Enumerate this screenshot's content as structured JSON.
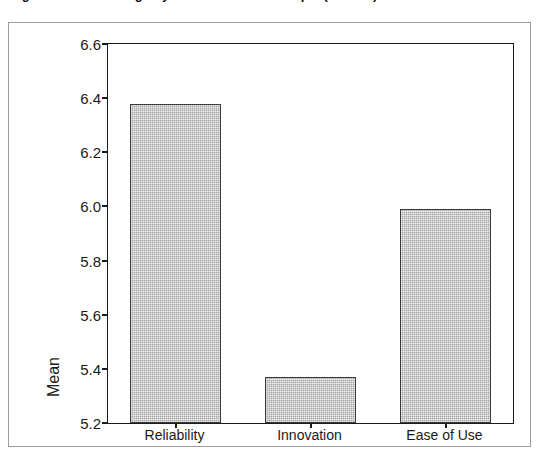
{
  "caption": {
    "text": "Figure 4. Mean ratings by attribute for the sample (n = 212)"
  },
  "chart_data": {
    "type": "bar",
    "title": "",
    "xlabel": "",
    "ylabel": "Mean",
    "categories": [
      "Reliability",
      "Innovation",
      "Ease of Use"
    ],
    "values": [
      6.38,
      5.37,
      5.99
    ],
    "ylim": [
      5.2,
      6.6
    ],
    "yticks": [
      "5.2",
      "5.4",
      "5.6",
      "5.8",
      "6.0",
      "6.2",
      "6.4",
      "6.6"
    ],
    "ytick_values": [
      5.2,
      5.4,
      5.6,
      5.8,
      6.0,
      6.2,
      6.4,
      6.6
    ],
    "grid": false,
    "legend": "none",
    "bar_fill_color": "#a6a6a6",
    "bar_border_color": "#3a3a3a",
    "axis_color": "#1a1a1a",
    "frame_color": "#9b9b9b",
    "background_color": "#ffffff"
  }
}
